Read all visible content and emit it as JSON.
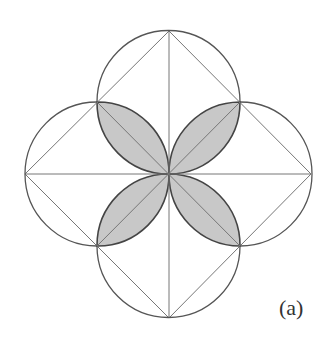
{
  "figure": {
    "label": "(a)",
    "center": [
      169,
      174
    ],
    "radius": 71.5,
    "circle_centers": [
      [
        169,
        102
      ],
      [
        97,
        174
      ],
      [
        240,
        174
      ],
      [
        169,
        246
      ]
    ],
    "outer_points": {
      "top": [
        169,
        31
      ],
      "right": [
        311,
        174
      ],
      "bottom": [
        169,
        318
      ],
      "left": [
        25,
        174
      ]
    },
    "corner_points": [
      [
        97,
        102
      ],
      [
        240,
        102
      ],
      [
        240,
        246
      ],
      [
        97,
        246
      ]
    ],
    "lens_fill": "#c8c8c8",
    "stroke_color": "#555555",
    "line_color": "#777777"
  }
}
